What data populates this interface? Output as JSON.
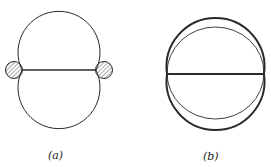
{
  "figures": [
    {
      "id": "a",
      "label": "(a)",
      "description": "Two overlapping equal circular arcs joined by a horizontal chord, with small hatched circles at each chord end"
    },
    {
      "id": "b",
      "label": "(b)",
      "description": "Two thick overlapping circular arcs joined by a thick horizontal chord, with a thin inner circle through the chord endpoints"
    }
  ],
  "colors": {
    "stroke": "#2a2a2a",
    "hatch": "#555555",
    "background": "#ffffff"
  }
}
